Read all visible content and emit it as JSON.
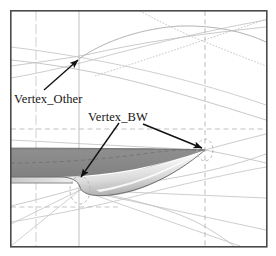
{
  "figure": {
    "kind": "cad-mesh-wireframe-airfoil",
    "background_color": "#ffffff",
    "frame": {
      "name": "plot-border",
      "x": 10,
      "y": 10,
      "width": 257,
      "height": 237,
      "stroke_color": "#4a4a4a",
      "stroke_width": 1.6
    },
    "colors": {
      "upper_surface_fill": "#8a8a8a",
      "upper_surface_fill_dark": "#7e7e7e",
      "lower_body_light": "#fdfdfd",
      "lower_body_mid": "#d8d8d8",
      "lower_body_edge": "#9c9c9c",
      "grid_line": "#b9b9b9",
      "grid_line_dashed": "#b0b0b0",
      "surface_outline": "#6e6e6e",
      "annotation": "#111111",
      "text": "#151515"
    },
    "labels": [
      {
        "name": "vertex-other",
        "text": "Vertex_Other",
        "x": 14,
        "y": 92
      },
      {
        "name": "vertex-bw",
        "text": "Vertex_BW",
        "x": 88,
        "y": 110
      }
    ],
    "annotations": [
      {
        "name": "arrow-to-vertex-other",
        "from_x": 44,
        "from_y": 90,
        "to_x": 79,
        "to_y": 59,
        "points_to": "Vertex_Other"
      },
      {
        "name": "arrow-to-vertex-bw-leading-edge",
        "from_x": 119,
        "from_y": 123,
        "to_x": 80,
        "to_y": 178,
        "points_to": "Vertex_BW"
      },
      {
        "name": "arrow-to-vertex-bw-trailing-edge",
        "from_x": 143,
        "from_y": 124,
        "to_x": 204,
        "to_y": 149,
        "points_to": "Vertex_BW"
      }
    ],
    "vertices": [
      {
        "name": "vertex-other-node",
        "x": 79,
        "y": 59
      },
      {
        "name": "vertex-bw-leading-edge-node",
        "x": 80,
        "y": 190
      },
      {
        "name": "vertex-bw-trailing-edge-node",
        "x": 205,
        "y": 150
      }
    ],
    "grid": {
      "vertical_solid_x": [
        36,
        79
      ],
      "vertical_dashed_x": [
        205
      ],
      "horizontal_dashed_y": [
        129,
        163,
        176,
        207
      ]
    }
  }
}
